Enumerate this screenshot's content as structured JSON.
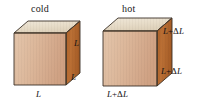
{
  "figure": {
    "background_color": "#ffffff"
  },
  "palette": {
    "top_face": "#e8ddcb",
    "front_face": "#dcb394",
    "right_face": "#b5682f",
    "edge_dark": "#3a3026",
    "edge_light": "#6b5a47",
    "text": "#141414"
  },
  "cubes": [
    {
      "id": "cold-cube",
      "caption": "cold",
      "caption_pos": {
        "x": 31,
        "y": 3
      },
      "labels": [
        {
          "id": "cold-height-label",
          "text": "L",
          "has_delta": false,
          "x": 74,
          "y": 38
        },
        {
          "id": "cold-depth-label",
          "text": "L",
          "has_delta": false,
          "x": 71,
          "y": 72
        },
        {
          "id": "cold-width-label",
          "text": "L",
          "has_delta": false,
          "x": 36,
          "y": 89
        }
      ],
      "geometry": {
        "front": "14,33 66,33 66,85 14,85",
        "top": "14,33 28,21 80,21 66,33",
        "right": "66,33 80,21 80,73 66,85"
      }
    },
    {
      "id": "hot-cube",
      "caption": "hot",
      "caption_pos": {
        "x": 122,
        "y": 3
      },
      "labels": [
        {
          "id": "hot-height-label",
          "text": "L",
          "has_delta": true,
          "x": 163,
          "y": 26
        },
        {
          "id": "hot-depth-label",
          "text": "L",
          "has_delta": true,
          "x": 161,
          "y": 66
        },
        {
          "id": "hot-width-label",
          "text": "L",
          "has_delta": true,
          "x": 107,
          "y": 89
        }
      ],
      "geometry": {
        "front": "103,31 157,31 157,86 103,86",
        "top": "103,31 118,18 172,18 157,31",
        "right": "157,31 172,18 172,73 157,86"
      }
    }
  ],
  "symbols": {
    "plus": "+",
    "delta": "Δ",
    "length": "L"
  }
}
